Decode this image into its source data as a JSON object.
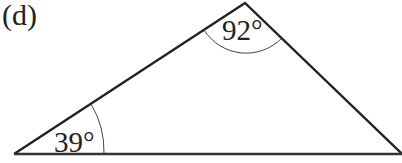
{
  "figure": {
    "label": "(d)",
    "shape": "triangle",
    "angles": [
      {
        "vertex": "top",
        "value": "92°"
      },
      {
        "vertex": "bottom-left",
        "value": "39°"
      }
    ],
    "stroke_color": "#222222"
  }
}
